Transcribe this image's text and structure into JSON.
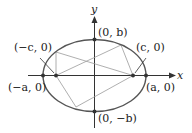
{
  "axes": {
    "x_label": "x",
    "y_label": "y"
  },
  "labels": {
    "top_vertex": "(0, b)",
    "bottom_vertex": "(0, −b)",
    "left_vertex": "(−a, 0)",
    "right_vertex": "(a, 0)",
    "left_focus": "(−c, 0)",
    "right_focus": "(c, 0)"
  },
  "colors": {
    "ellipse": "#555555",
    "axes": "#333333",
    "rays": "#9a9a9a",
    "points": "#333333"
  }
}
